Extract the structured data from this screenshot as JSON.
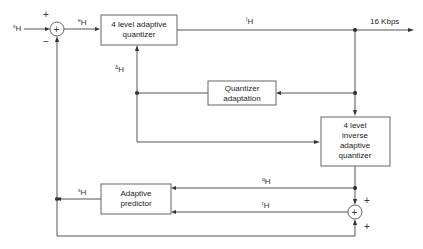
{
  "diagram": {
    "blocks": {
      "quantizer": {
        "line1": "4 level adaptive",
        "line2": "quantizer"
      },
      "adaptation": {
        "line1": "Quantizer",
        "line2": "adaptation"
      },
      "inverse": {
        "line1": "4 level",
        "line2": "inverse",
        "line3": "adaptive",
        "line4": "quantizer"
      },
      "predictor": {
        "line1": "Adaptive",
        "line2": "predictor"
      }
    },
    "summers": {
      "input": {
        "symbol": "+",
        "top_sign": "+",
        "bottom_sign": "−"
      },
      "reconstruct": {
        "symbol": "+",
        "top_sign": "+",
        "bottom_sign": "+"
      }
    },
    "signals": {
      "input": {
        "sup": "s",
        "base": "H"
      },
      "difference": {
        "sup": "e",
        "base": "H"
      },
      "code": {
        "sup": "I",
        "base": "H"
      },
      "step": {
        "sup": "Δ",
        "base": "H"
      },
      "dq": {
        "sup": "q",
        "base": "H"
      },
      "r": {
        "sup": "r",
        "base": "H"
      },
      "estimate": {
        "sup": "s",
        "base": "H"
      }
    },
    "output_rate": "16 Kbps"
  }
}
